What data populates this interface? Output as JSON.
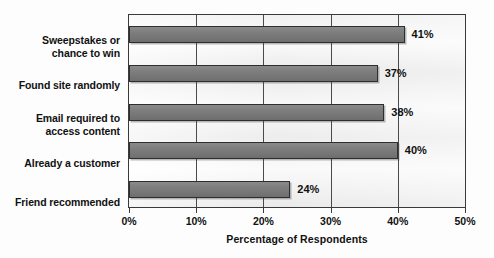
{
  "chart_data": {
    "type": "bar",
    "orientation": "horizontal",
    "title": "",
    "xlabel": "Percentage of Respondents",
    "ylabel": "",
    "xlim": [
      0,
      50
    ],
    "grid": true,
    "legend": "none",
    "categories": [
      "Sweepstakes or chance to win",
      "Found site randomly",
      "Email required to access content",
      "Already a customer",
      "Friend recommended"
    ],
    "values": [
      41,
      37,
      38,
      40,
      24
    ],
    "value_labels": [
      "41%",
      "37%",
      "38%",
      "40%",
      "24%"
    ],
    "xticks": [
      0,
      10,
      20,
      30,
      40,
      50
    ],
    "xtick_labels": [
      "0%",
      "10%",
      "20%",
      "30%",
      "40%",
      "50%"
    ],
    "bar_color": "#7b7b7b",
    "bar_border_color": "#2e2e2e",
    "plot_border_color": "#3a3a3a",
    "gridline_color": "#4a4a4a",
    "text_color": "#111111"
  },
  "labels": {
    "category_lines": [
      [
        "Sweepstakes or",
        "chance to win"
      ],
      [
        "Found site randomly"
      ],
      [
        "Email required to",
        "access content"
      ],
      [
        "Already a customer"
      ],
      [
        "Friend recommended"
      ]
    ]
  }
}
